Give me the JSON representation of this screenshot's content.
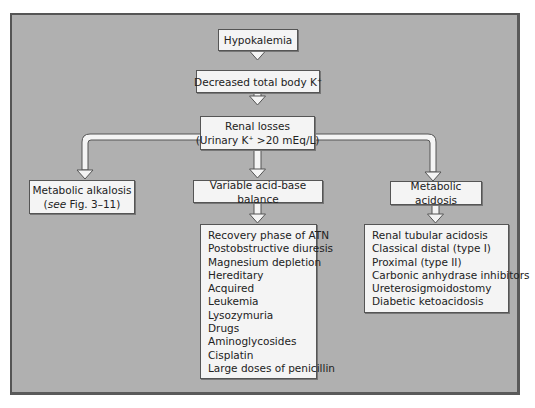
{
  "diagram": {
    "title_node": "Hypokalemia",
    "level2": {
      "text": "Decreased total body K",
      "superscript": "+"
    },
    "level3": {
      "line1": "Renal losses",
      "line2_prefix": "(Urinary K",
      "line2_superscript": "+",
      "line2_suffix": " >20 mEq/L)"
    },
    "branches": [
      {
        "id": "alkalosis",
        "label": "Metabolic alkalosis",
        "sub_italic": "see",
        "sub_rest": " Fig. 3–11",
        "sub_open": "(",
        "sub_close": ")"
      },
      {
        "id": "variable",
        "label": "Variable acid-base balance",
        "items": [
          "Recovery phase of ATN",
          "Postobstructive diuresis",
          "Magnesium depletion",
          "Hereditary",
          "Acquired",
          "Leukemia",
          "Lysozymuria",
          "Drugs",
          "Aminoglycosides",
          "Cisplatin",
          "Large doses of penicillin"
        ]
      },
      {
        "id": "acidosis",
        "label": "Metabolic acidosis",
        "items": [
          "Renal tubular acidosis",
          "Classical distal (type I)",
          "Proximal (type II)",
          "Carbonic anhydrase inhibitors",
          "Ureterosigmoidostomy",
          "Diabetic ketoacidosis"
        ]
      }
    ],
    "colors": {
      "background": "#b0b0b0",
      "node_fill": "#f4f4f4",
      "border": "#555555",
      "arrow_fill": "#f4f4f4"
    }
  }
}
